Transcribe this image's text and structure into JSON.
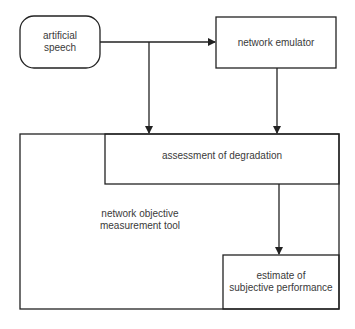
{
  "diagram": {
    "nodes": {
      "artificial_speech": {
        "label_line1": "artificial",
        "label_line2": "speech",
        "shape": "rounded-rectangle"
      },
      "network_emulator": {
        "label": "network emulator",
        "shape": "rectangle"
      },
      "assessment": {
        "label": "assessment of degradation",
        "shape": "rectangle"
      },
      "measurement_tool": {
        "label_line1": "network objective",
        "label_line2": "measurement tool",
        "shape": "container"
      },
      "estimate": {
        "label_line1": "estimate of",
        "label_line2": "subjective performance",
        "shape": "rectangle"
      }
    },
    "edges": [
      {
        "from": "artificial speech",
        "to": "network emulator"
      },
      {
        "from": "artificial speech",
        "to": "assessment of degradation"
      },
      {
        "from": "network emulator",
        "to": "assessment of degradation"
      },
      {
        "from": "assessment of degradation",
        "to": "estimate of subjective performance"
      }
    ]
  }
}
